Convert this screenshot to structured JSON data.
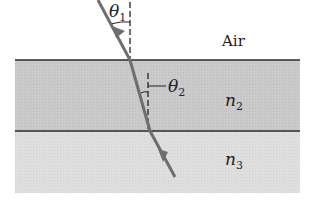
{
  "diagram": {
    "labels": {
      "theta1": "θ",
      "theta1_sub": "1",
      "theta2": "θ",
      "theta2_sub": "2",
      "air": "Air",
      "n2": "n",
      "n2_sub": "2",
      "n3": "n",
      "n3_sub": "3"
    },
    "regions": [
      {
        "name": "Air",
        "top": 0,
        "bottom": 60
      },
      {
        "name": "n2",
        "top": 60,
        "bottom": 131,
        "color": "#c9c9c9"
      },
      {
        "name": "n3",
        "top": 131,
        "bottom": 193,
        "color": "#dedede"
      }
    ],
    "colors": {
      "ray": "#6e6e6e",
      "interface": "#2a2a2a",
      "layer_n2": "#c9c9c9",
      "layer_n3": "#dedede"
    }
  }
}
